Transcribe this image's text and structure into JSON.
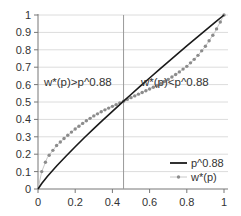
{
  "chart_data": {
    "type": "line",
    "title": "",
    "xlabel": "",
    "ylabel": "",
    "xlim": [
      0,
      1
    ],
    "ylim": [
      0,
      1
    ],
    "grid": "horizontal",
    "legend_position": "lower-right",
    "x_ticks": [
      "0",
      "0.2",
      "0.4",
      "0.6",
      "0.8",
      "1"
    ],
    "y_ticks": [
      "0",
      "0.1",
      "0.2",
      "0.3",
      "0.4",
      "0.5",
      "0.6",
      "0.7",
      "0.8",
      "0.9",
      "1"
    ],
    "reference_line": {
      "orientation": "vertical",
      "x": 0.46,
      "color": "#9a9a9a"
    },
    "annotations": [
      {
        "text": "w*(p)>p^0.88",
        "x": 0.02,
        "y": 0.6
      },
      {
        "text": "w*(p)<p^0.88",
        "x": 0.6,
        "y": 0.6
      }
    ],
    "series": [
      {
        "name": "p^0.88",
        "style": "solid line",
        "color": "#1a1a1a",
        "x": [
          0,
          0.02,
          0.05,
          0.1,
          0.15,
          0.2,
          0.25,
          0.3,
          0.35,
          0.4,
          0.46,
          0.5,
          0.55,
          0.6,
          0.65,
          0.7,
          0.75,
          0.8,
          0.85,
          0.9,
          0.95,
          1
        ],
        "values": [
          0,
          0.032,
          0.072,
          0.132,
          0.188,
          0.243,
          0.296,
          0.347,
          0.397,
          0.446,
          0.505,
          0.543,
          0.591,
          0.638,
          0.685,
          0.731,
          0.776,
          0.822,
          0.867,
          0.911,
          0.956,
          1
        ]
      },
      {
        "name": "w*(p)",
        "style": "dotted markers",
        "color": "#8c8c8c",
        "x": [
          0,
          0.02,
          0.05,
          0.1,
          0.15,
          0.2,
          0.25,
          0.3,
          0.35,
          0.4,
          0.46,
          0.5,
          0.55,
          0.6,
          0.65,
          0.7,
          0.75,
          0.8,
          0.85,
          0.9,
          0.95,
          1
        ],
        "values": [
          0,
          0.1,
          0.18,
          0.25,
          0.3,
          0.345,
          0.385,
          0.42,
          0.45,
          0.475,
          0.505,
          0.525,
          0.55,
          0.575,
          0.6,
          0.63,
          0.665,
          0.705,
          0.755,
          0.82,
          0.9,
          1
        ]
      }
    ]
  },
  "legend": {
    "items": [
      {
        "label": "p^0.88"
      },
      {
        "label": "w*(p)"
      }
    ]
  }
}
